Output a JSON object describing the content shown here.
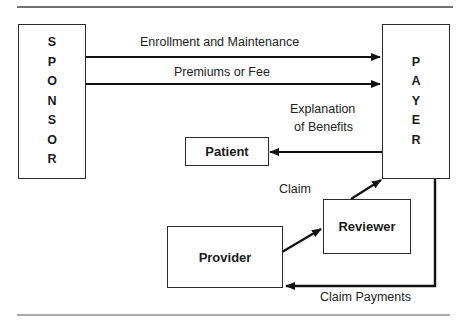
{
  "diagram": {
    "type": "flow-diagram",
    "nodes": {
      "sponsor": {
        "label": "SPONSOR",
        "letters": [
          "S",
          "P",
          "O",
          "N",
          "S",
          "O",
          "R"
        ]
      },
      "payer": {
        "label": "PAYER",
        "letters": [
          "P",
          "A",
          "Y",
          "E",
          "R"
        ]
      },
      "patient": {
        "label": "Patient"
      },
      "reviewer": {
        "label": "Reviewer"
      },
      "provider": {
        "label": "Provider"
      }
    },
    "edges": {
      "enrollment": {
        "from": "Sponsor",
        "to": "Payer",
        "label": "Enrollment and Maintenance"
      },
      "premiums": {
        "from": "Sponsor",
        "to": "Payer",
        "label": "Premiums or Fee"
      },
      "eob": {
        "from": "Payer",
        "to": "Patient",
        "label_line1": "Explanation",
        "label_line2": "of Benefits"
      },
      "claim": {
        "from": "Provider",
        "to": "Payer",
        "via": "Reviewer",
        "label": "Claim"
      },
      "claim_payments": {
        "from": "Payer",
        "to": "Provider",
        "label": "Claim Payments"
      }
    }
  }
}
